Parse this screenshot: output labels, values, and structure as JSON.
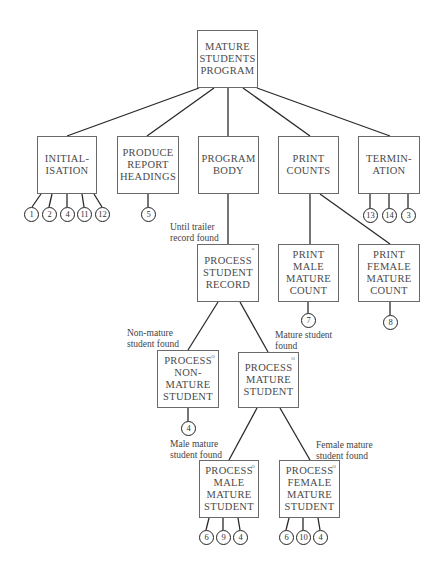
{
  "diagram": {
    "type": "jackson-structure-chart",
    "nodes": {
      "root": "MATURE\nSTUDENTS\nPROGRAM",
      "init": "INITIAL-\nISATION",
      "headings": "PRODUCE\nREPORT\nHEADINGS",
      "body": "PROGRAM\nBODY",
      "counts": "PRINT\nCOUNTS",
      "term": "TERMIN-\nATION",
      "record": "PROCESS\nSTUDENT\nRECORD",
      "male_count": "PRINT\nMALE\nMATURE\nCOUNT",
      "female_count": "PRINT\nFEMALE\nMATURE\nCOUNT",
      "non_mature": "PROCESS\nNON-\nMATURE\nSTUDENT",
      "mature": "PROCESS\nMATURE\nSTUDENT",
      "male_mature": "PROCESS\nMALE\nMATURE\nSTUDENT",
      "female_mature": "PROCESS\nFEMALE\nMATURE\nSTUDENT"
    },
    "markers": {
      "iteration": "*",
      "selection": "o"
    },
    "conditions": {
      "until_trailer": "Until trailer\nrecord found",
      "non_mature_found": "Non-mature\nstudent found",
      "mature_found": "Mature student\nfound",
      "male_found": "Male mature\nstudent found",
      "female_found": "Female mature\nstudent found"
    },
    "operations": {
      "init": [
        "1",
        "2",
        "4",
        "11",
        "12"
      ],
      "headings": [
        "5"
      ],
      "term": [
        "13",
        "14",
        "3"
      ],
      "male_count": [
        "7"
      ],
      "female_count": [
        "8"
      ],
      "non_mature": [
        "4"
      ],
      "male_mature": [
        "6",
        "9",
        "4"
      ],
      "female_mature": [
        "6",
        "10",
        "4"
      ]
    }
  }
}
